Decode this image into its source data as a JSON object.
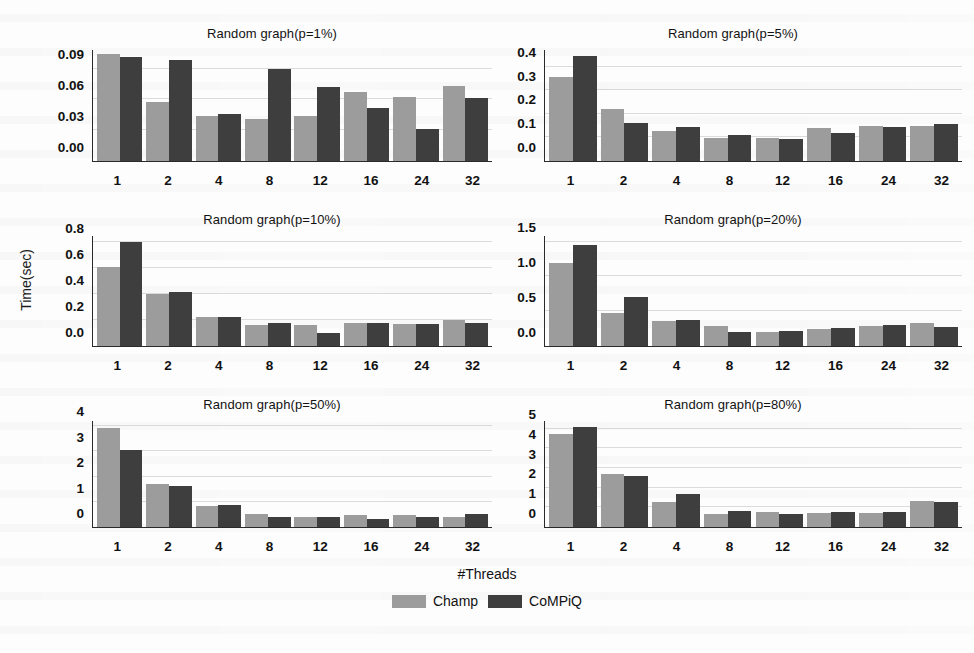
{
  "figure": {
    "ylabel": "Time(sec)",
    "xlabel": "#Threads",
    "legend": [
      {
        "name": "Champ",
        "color": "#9c9c9c"
      },
      {
        "name": "CoMPiQ",
        "color": "#3e3e3e"
      }
    ]
  },
  "chart_data": [
    {
      "type": "bar",
      "title": "Random graph(p=1%)",
      "xlabel": "#Threads",
      "ylabel": "Time(sec)",
      "categories": [
        "1",
        "2",
        "4",
        "8",
        "12",
        "16",
        "24",
        "32"
      ],
      "yticks": [
        "0.00",
        "0.03",
        "0.06",
        "0.09"
      ],
      "ytick_values": [
        0.0,
        0.03,
        0.06,
        0.09
      ],
      "ylim": [
        0,
        0.108
      ],
      "grid": true,
      "legend_position": "figure-bottom",
      "series": [
        {
          "name": "Champ",
          "values": [
            0.104,
            0.057,
            0.044,
            0.041,
            0.044,
            0.067,
            0.062,
            0.073
          ]
        },
        {
          "name": "CoMPiQ",
          "values": [
            0.101,
            0.098,
            0.046,
            0.09,
            0.072,
            0.052,
            0.031,
            0.061
          ]
        }
      ]
    },
    {
      "type": "bar",
      "title": "Random graph(p=5%)",
      "xlabel": "#Threads",
      "ylabel": "Time(sec)",
      "categories": [
        "1",
        "2",
        "4",
        "8",
        "12",
        "16",
        "24",
        "32"
      ],
      "yticks": [
        "0.0",
        "0.1",
        "0.2",
        "0.3",
        "0.4"
      ],
      "ytick_values": [
        0.0,
        0.1,
        0.2,
        0.3,
        0.4
      ],
      "ylim": [
        0,
        0.47
      ],
      "grid": true,
      "legend_position": "figure-bottom",
      "series": [
        {
          "name": "Champ",
          "values": [
            0.355,
            0.222,
            0.125,
            0.098,
            0.098,
            0.138,
            0.147,
            0.15
          ]
        },
        {
          "name": "CoMPiQ",
          "values": [
            0.445,
            0.16,
            0.142,
            0.112,
            0.092,
            0.119,
            0.146,
            0.157
          ]
        }
      ]
    },
    {
      "type": "bar",
      "title": "Random graph(p=10%)",
      "xlabel": "#Threads",
      "ylabel": "Time(sec)",
      "categories": [
        "1",
        "2",
        "4",
        "8",
        "12",
        "16",
        "24",
        "32"
      ],
      "yticks": [
        "0.0",
        "0.2",
        "0.4",
        "0.6",
        "0.8"
      ],
      "ytick_values": [
        0.0,
        0.2,
        0.4,
        0.6,
        0.8
      ],
      "ylim": [
        0,
        0.85
      ],
      "grid": true,
      "legend_position": "figure-bottom",
      "series": [
        {
          "name": "Champ",
          "values": [
            0.61,
            0.405,
            0.228,
            0.16,
            0.163,
            0.175,
            0.168,
            0.203
          ]
        },
        {
          "name": "CoMPiQ",
          "values": [
            0.8,
            0.418,
            0.222,
            0.18,
            0.102,
            0.178,
            0.167,
            0.178
          ]
        }
      ]
    },
    {
      "type": "bar",
      "title": "Random graph(p=20%)",
      "xlabel": "#Threads",
      "ylabel": "Time(sec)",
      "categories": [
        "1",
        "2",
        "4",
        "8",
        "12",
        "16",
        "24",
        "32"
      ],
      "yticks": [
        "0.0",
        "0.5",
        "1.0",
        "1.5"
      ],
      "ytick_values": [
        0.0,
        0.5,
        1.0,
        1.5
      ],
      "ylim": [
        0,
        1.58
      ],
      "grid": true,
      "legend_position": "figure-bottom",
      "series": [
        {
          "name": "Champ",
          "values": [
            1.19,
            0.48,
            0.36,
            0.285,
            0.205,
            0.245,
            0.285,
            0.325
          ]
        },
        {
          "name": "CoMPiQ",
          "values": [
            1.45,
            0.71,
            0.375,
            0.195,
            0.215,
            0.265,
            0.295,
            0.272
          ]
        }
      ]
    },
    {
      "type": "bar",
      "title": "Random graph(p=50%)",
      "xlabel": "#Threads",
      "ylabel": "Time(sec)",
      "categories": [
        "1",
        "2",
        "4",
        "8",
        "12",
        "16",
        "24",
        "32"
      ],
      "yticks": [
        "0",
        "1",
        "2",
        "3",
        "4"
      ],
      "ytick_values": [
        0,
        1,
        2,
        3,
        4
      ],
      "ylim": [
        0,
        4.2
      ],
      "grid": true,
      "legend_position": "figure-bottom",
      "series": [
        {
          "name": "Champ",
          "values": [
            3.92,
            1.7,
            0.82,
            0.52,
            0.4,
            0.48,
            0.47,
            0.4
          ]
        },
        {
          "name": "CoMPiQ",
          "values": [
            3.05,
            1.63,
            0.88,
            0.38,
            0.38,
            0.32,
            0.4,
            0.53
          ]
        }
      ]
    },
    {
      "type": "bar",
      "title": "Random graph(p=80%)",
      "xlabel": "#Threads",
      "ylabel": "Time(sec)",
      "categories": [
        "1",
        "2",
        "4",
        "8",
        "12",
        "16",
        "24",
        "32"
      ],
      "yticks": [
        "0",
        "1",
        "2",
        "3",
        "4",
        "5"
      ],
      "ytick_values": [
        0,
        1,
        2,
        3,
        4,
        5
      ],
      "ylim": [
        0,
        5.4
      ],
      "grid": true,
      "legend_position": "figure-bottom",
      "series": [
        {
          "name": "Champ",
          "values": [
            4.72,
            2.72,
            1.28,
            0.68,
            0.76,
            0.72,
            0.7,
            1.35
          ]
        },
        {
          "name": "CoMPiQ",
          "values": [
            5.08,
            2.58,
            1.66,
            0.82,
            0.66,
            0.74,
            0.74,
            1.25
          ]
        }
      ]
    }
  ]
}
